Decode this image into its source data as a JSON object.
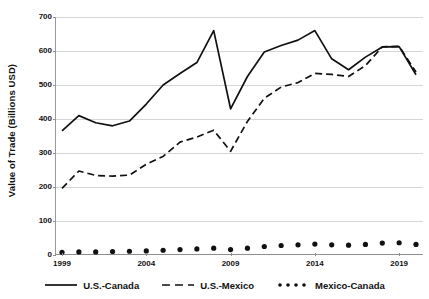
{
  "chart_data": {
    "type": "line",
    "title": "",
    "xlabel": "",
    "ylabel": "Value of Trade (Billions USD)",
    "ylim": [
      0,
      700
    ],
    "ytick_values": [
      0,
      100,
      200,
      300,
      400,
      500,
      600,
      700
    ],
    "ytick_labels": [
      "0",
      "100",
      "200",
      "300",
      "400",
      "500",
      "600",
      "700"
    ],
    "xlim": [
      1999,
      2020
    ],
    "xtick_values": [
      1999,
      2004,
      2009,
      2014,
      2019
    ],
    "xtick_labels": [
      "1999",
      "2004",
      "2009",
      "2014",
      "2019"
    ],
    "x": [
      1999,
      2000,
      2001,
      2002,
      2003,
      2004,
      2005,
      2006,
      2007,
      2008,
      2009,
      2010,
      2011,
      2012,
      2013,
      2014,
      2015,
      2016,
      2017,
      2018,
      2019,
      2020
    ],
    "grid": "horizontal",
    "legend_position": "bottom",
    "series": [
      {
        "name": "U.S.-Canada",
        "style": "solid",
        "color": "#111111",
        "values": [
          365,
          410,
          389,
          380,
          394,
          444,
          500,
          534,
          566,
          660,
          430,
          525,
          597,
          616,
          632,
          660,
          577,
          545,
          582,
          612,
          613,
          530
        ]
      },
      {
        "name": "U.S.-Mexico",
        "style": "dashed",
        "color": "#111111",
        "values": [
          196,
          247,
          234,
          232,
          235,
          267,
          290,
          332,
          347,
          367,
          305,
          393,
          461,
          494,
          507,
          534,
          531,
          525,
          557,
          612,
          614,
          538
        ]
      },
      {
        "name": "Mexico-Canada",
        "style": "dotted",
        "color": "#111111",
        "values": [
          8,
          9,
          9,
          10,
          11,
          12,
          14,
          16,
          18,
          20,
          16,
          20,
          25,
          28,
          30,
          32,
          30,
          29,
          31,
          35,
          36,
          31
        ]
      }
    ]
  },
  "legend": {
    "items": [
      {
        "label": "U.S.-Canada",
        "swatch": "solid-line-swatch"
      },
      {
        "label": "U.S.-Mexico",
        "swatch": "dashed-line-swatch"
      },
      {
        "label": "Mexico-Canada",
        "swatch": "dotted-line-swatch"
      }
    ]
  }
}
